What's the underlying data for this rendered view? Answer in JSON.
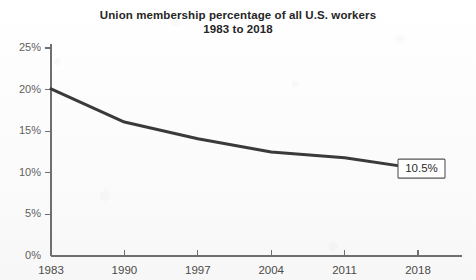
{
  "chart_data": {
    "type": "line",
    "title": "Union membership percentage of all U.S. workers",
    "subtitle": "1983 to 2018",
    "title_lines": [
      "Union membership percentage of all U.S. workers",
      "1983 to 2018"
    ],
    "xlabel": "",
    "ylabel": "",
    "x": [
      1983,
      1990,
      1997,
      2004,
      2011,
      2018
    ],
    "values": [
      20.1,
      16.1,
      14.1,
      12.5,
      11.8,
      10.5
    ],
    "series": [
      {
        "name": "Union membership percentage",
        "values": [
          20.1,
          16.1,
          14.1,
          12.5,
          11.8,
          10.5
        ]
      }
    ],
    "xticks": [
      "1983",
      "1990",
      "1997",
      "2004",
      "2011",
      "2018"
    ],
    "yticks": [
      "0%",
      "5%",
      "10%",
      "15%",
      "20%",
      "25%"
    ],
    "ytick_values": [
      0,
      5,
      10,
      15,
      20,
      25
    ],
    "ylim": [
      0,
      25
    ],
    "xlim": [
      1983,
      2018
    ],
    "grid": false,
    "legend": false,
    "annotations": [
      {
        "label": "10.5%",
        "x": 2018,
        "y": 10.5,
        "style": "boxed-callout"
      }
    ],
    "colors": {
      "line": "#3a3a3a",
      "axis": "#6f6f6f",
      "tick_label": "#5f5f5f",
      "title": "#262626",
      "background": "#fdfdfd",
      "callout_border": "#555555"
    }
  }
}
